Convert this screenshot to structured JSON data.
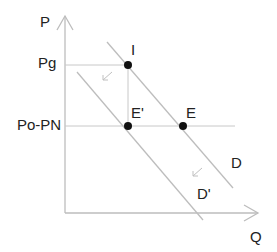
{
  "diagram": {
    "axes": {
      "y_label": "P",
      "x_label": "Q"
    },
    "price_levels": [
      {
        "label": "Pg",
        "y": 65
      },
      {
        "label": "Po-PN",
        "y": 126
      }
    ],
    "points": [
      {
        "label": "I",
        "x": 128,
        "y": 65
      },
      {
        "label": "E'",
        "x": 128,
        "y": 126
      },
      {
        "label": "E",
        "x": 183,
        "y": 126
      }
    ],
    "curves": [
      {
        "label": "D",
        "from": [
          107,
          42
        ],
        "to": [
          233,
          188
        ]
      },
      {
        "label": "D'",
        "from": [
          77,
          72
        ],
        "to": [
          203,
          220
        ]
      }
    ],
    "shift_arrows": [
      {
        "from": [
          112,
          72
        ],
        "to": [
          103,
          80
        ]
      },
      {
        "from": [
          202,
          168
        ],
        "to": [
          193,
          176
        ]
      }
    ],
    "colors": {
      "line": "#bdbdbd",
      "point": "#111111",
      "text": "#222222"
    }
  }
}
